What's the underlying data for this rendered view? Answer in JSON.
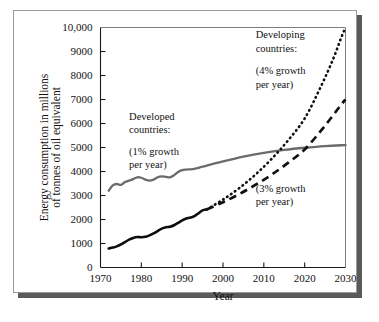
{
  "figure": {
    "frame_border_color": "#9a9a9a",
    "shadow_color": "#5a5a5a"
  },
  "chart_data": {
    "type": "line",
    "title": "",
    "xlabel": "Year",
    "ylabel": "Energy consumption in millions of tonnes of oil equivalent",
    "ylabel_line1": "Energy consumption in millions",
    "ylabel_line2": "of tonnes of oil equivalent",
    "xlim": [
      1970,
      2030
    ],
    "ylim": [
      0,
      10000
    ],
    "grid": false,
    "legend_position": "inline-annotations",
    "xticks": [
      1970,
      1980,
      1990,
      2000,
      2010,
      2020,
      2030
    ],
    "xtick_labels": [
      "1970",
      "1980",
      "1990",
      "2000",
      "2010",
      "2020",
      "2030"
    ],
    "yticks": [
      0,
      1000,
      2000,
      3000,
      4000,
      5000,
      6000,
      7000,
      8000,
      9000,
      10000
    ],
    "ytick_labels": [
      "0",
      "1000",
      "2000",
      "3000",
      "4000",
      "5000",
      "6000",
      "7000",
      "8000",
      "9000",
      "10,000"
    ],
    "annotations": [
      {
        "id": "developed-label",
        "text": "Developed",
        "x": 1977,
        "y": 6150
      },
      {
        "id": "developed-label2",
        "text": "countries:",
        "x": 1977,
        "y": 5600
      },
      {
        "id": "developed-growth",
        "text": "(1% growth",
        "x": 1977,
        "y": 4700
      },
      {
        "id": "developed-growth2",
        "text": "per year)",
        "x": 1977,
        "y": 4150
      },
      {
        "id": "developing-label",
        "text": "Developing",
        "x": 2008,
        "y": 9550
      },
      {
        "id": "developing-label2",
        "text": "countries:",
        "x": 2008,
        "y": 9000
      },
      {
        "id": "developing-growth4",
        "text": "(4% growth",
        "x": 2008,
        "y": 8050
      },
      {
        "id": "developing-growth4b",
        "text": "per year)",
        "x": 2008,
        "y": 7500
      },
      {
        "id": "developing-growth3",
        "text": "(3% growth",
        "x": 2008,
        "y": 3150
      },
      {
        "id": "developing-growth3b",
        "text": "per year)",
        "x": 2008,
        "y": 2600
      }
    ],
    "series": [
      {
        "name": "Developed countries (1% growth per year)",
        "style": "solid",
        "color": "#6b6b6b",
        "points": [
          [
            1972,
            3200
          ],
          [
            1973,
            3420
          ],
          [
            1974,
            3480
          ],
          [
            1975,
            3440
          ],
          [
            1976,
            3560
          ],
          [
            1977,
            3620
          ],
          [
            1978,
            3680
          ],
          [
            1979,
            3760
          ],
          [
            1980,
            3740
          ],
          [
            1981,
            3660
          ],
          [
            1982,
            3620
          ],
          [
            1983,
            3660
          ],
          [
            1984,
            3760
          ],
          [
            1985,
            3800
          ],
          [
            1986,
            3780
          ],
          [
            1987,
            3760
          ],
          [
            1988,
            3840
          ],
          [
            1989,
            3980
          ],
          [
            1990,
            4060
          ],
          [
            1991,
            4080
          ],
          [
            1992,
            4090
          ],
          [
            1993,
            4110
          ],
          [
            1994,
            4150
          ],
          [
            1995,
            4200
          ],
          [
            2000,
            4420
          ],
          [
            2005,
            4620
          ],
          [
            2010,
            4780
          ],
          [
            2015,
            4900
          ],
          [
            2020,
            4990
          ],
          [
            2025,
            5060
          ],
          [
            2030,
            5100
          ]
        ]
      },
      {
        "name": "Developing countries (historical)",
        "style": "solid",
        "color": "#0d0d0d",
        "points": [
          [
            1972,
            790
          ],
          [
            1973,
            830
          ],
          [
            1974,
            880
          ],
          [
            1975,
            960
          ],
          [
            1976,
            1060
          ],
          [
            1977,
            1160
          ],
          [
            1978,
            1230
          ],
          [
            1979,
            1270
          ],
          [
            1980,
            1260
          ],
          [
            1981,
            1280
          ],
          [
            1982,
            1340
          ],
          [
            1983,
            1420
          ],
          [
            1984,
            1520
          ],
          [
            1985,
            1620
          ],
          [
            1986,
            1680
          ],
          [
            1987,
            1700
          ],
          [
            1988,
            1760
          ],
          [
            1989,
            1860
          ],
          [
            1990,
            1960
          ],
          [
            1991,
            2040
          ],
          [
            1992,
            2080
          ],
          [
            1993,
            2140
          ],
          [
            1994,
            2260
          ],
          [
            1995,
            2380
          ],
          [
            1996,
            2420
          ]
        ]
      },
      {
        "name": "Developing countries (4% growth per year)",
        "style": "dotted",
        "color": "#111111",
        "points": [
          [
            1996,
            2420
          ],
          [
            2000,
            2830
          ],
          [
            2004,
            3310
          ],
          [
            2008,
            3880
          ],
          [
            2012,
            4540
          ],
          [
            2016,
            5310
          ],
          [
            2020,
            6210
          ],
          [
            2024,
            7550
          ],
          [
            2027,
            8700
          ],
          [
            2029,
            9600
          ],
          [
            2030,
            10000
          ]
        ]
      },
      {
        "name": "Developing countries (3% growth per year)",
        "style": "dashed",
        "color": "#111111",
        "points": [
          [
            1996,
            2420
          ],
          [
            2000,
            2720
          ],
          [
            2004,
            3060
          ],
          [
            2008,
            3450
          ],
          [
            2012,
            3880
          ],
          [
            2016,
            4370
          ],
          [
            2020,
            4920
          ],
          [
            2024,
            5700
          ],
          [
            2027,
            6350
          ],
          [
            2029,
            6800
          ],
          [
            2030,
            7000
          ]
        ]
      }
    ]
  }
}
